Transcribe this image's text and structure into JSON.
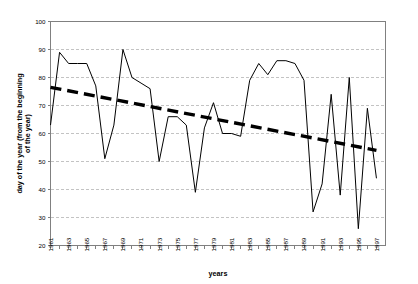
{
  "chart_data": {
    "type": "line",
    "title": "",
    "xlabel": "years",
    "ylabel": "day of the year (from the beginning of the year)",
    "xlim": [
      1961,
      1998
    ],
    "ylim": [
      20,
      100
    ],
    "ytick_values": [
      20,
      30,
      40,
      50,
      60,
      70,
      80,
      90,
      100
    ],
    "ytick_labels": [
      "20",
      "30",
      "40",
      "50",
      "60",
      "70",
      "80",
      "90",
      "100"
    ],
    "xtick_labels": [
      "1961",
      "1963",
      "1965",
      "1967",
      "1969",
      "1971",
      "1973",
      "1975",
      "1977",
      "1979",
      "1981",
      "1983",
      "1985",
      "1987",
      "1989",
      "1991",
      "1993",
      "1995",
      "1997"
    ],
    "grid": "horizontal-dashed",
    "legend": "none",
    "x": [
      1961,
      1962,
      1963,
      1964,
      1965,
      1966,
      1967,
      1968,
      1969,
      1970,
      1971,
      1972,
      1973,
      1974,
      1975,
      1976,
      1977,
      1978,
      1979,
      1980,
      1981,
      1982,
      1983,
      1984,
      1985,
      1986,
      1987,
      1988,
      1989,
      1990,
      1991,
      1992,
      1993,
      1994,
      1995,
      1996,
      1997
    ],
    "series": [
      {
        "name": "day of the year",
        "style": "thin-solid-black",
        "values": [
          63,
          89,
          85,
          85,
          85,
          77,
          51,
          63,
          90,
          80,
          78,
          76,
          50,
          66,
          66,
          63,
          39,
          62,
          71,
          60,
          60,
          59,
          79,
          85,
          81,
          86,
          86,
          85,
          79,
          32,
          42,
          74,
          38,
          80,
          26,
          69,
          44
        ]
      },
      {
        "name": "linear trend",
        "style": "thick-dashed-black",
        "endpoints": [
          [
            1961,
            76.5
          ],
          [
            1997,
            54.0
          ]
        ]
      }
    ]
  },
  "axis_titles": {
    "x": "years",
    "y_line1": "day of the year (from the beginning",
    "y_line2": "of the year)"
  },
  "colors": {
    "data_line": "#000000",
    "trend_line": "#000000",
    "gridline": "#b4b4b4",
    "axis": "#808080",
    "background": "#ffffff"
  }
}
